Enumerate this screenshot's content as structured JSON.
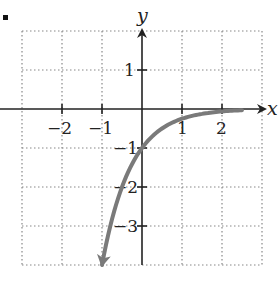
{
  "chart_data": {
    "type": "line",
    "title": "",
    "xlabel": "x",
    "ylabel": "y",
    "xlim": [
      -3,
      3
    ],
    "ylim": [
      -4,
      2
    ],
    "grid": true,
    "grid_style": "dotted",
    "x_ticks": [
      -2,
      -1,
      1,
      2
    ],
    "y_ticks": [
      1,
      -1,
      -2,
      -3
    ],
    "x_tick_labels": [
      "−2",
      "−1",
      "1",
      "2"
    ],
    "y_tick_labels": [
      "1",
      "−1",
      "−2",
      "−3"
    ],
    "series": [
      {
        "name": "curve",
        "color": "#7a7a7a",
        "arrow_end": "lower-left",
        "x": [
          -1.0,
          -0.75,
          -0.5,
          -0.25,
          0,
          0.25,
          0.5,
          1.0,
          1.5,
          2.0,
          2.5
        ],
        "values": [
          -4.0,
          -2.83,
          -2.0,
          -1.41,
          -1.0,
          -0.71,
          -0.5,
          -0.25,
          -0.125,
          -0.0625,
          -0.031
        ]
      }
    ],
    "annotations": []
  },
  "labels": {
    "x_axis": "x",
    "y_axis": "y",
    "x_ticks": [
      "−2",
      "−1",
      "1",
      "2"
    ],
    "y_ticks": [
      "1",
      "−1",
      "−2",
      "−3"
    ]
  },
  "colors": {
    "axis": "#222222",
    "grid": "#888888",
    "curve": "#7a7a7a"
  }
}
